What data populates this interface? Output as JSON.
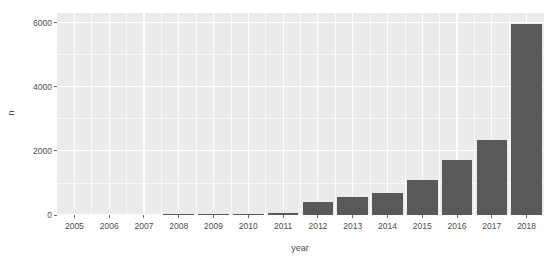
{
  "chart_data": {
    "type": "bar",
    "title": "",
    "xlabel": "year",
    "ylabel": "n",
    "categories": [
      "2005",
      "2006",
      "2007",
      "2008",
      "2009",
      "2010",
      "2011",
      "2012",
      "2013",
      "2014",
      "2015",
      "2016",
      "2017",
      "2018"
    ],
    "values": [
      0,
      0,
      0,
      25,
      20,
      30,
      75,
      420,
      560,
      700,
      1100,
      1730,
      2350,
      5950
    ],
    "ylim": [
      0,
      6300
    ],
    "y_ticks": [
      0,
      2000,
      4000,
      6000
    ],
    "y_tick_labels": [
      "0",
      "2000",
      "4000",
      "6000"
    ],
    "y_minor_ticks": [
      1000,
      3000,
      5000
    ],
    "grid": true,
    "legend": "none",
    "bar_color": "#595959",
    "panel_color": "#ebebeb",
    "grid_color": "#ffffff",
    "text_color": "#4d4d4d"
  },
  "axes": {
    "y_title": "n",
    "x_title": "year"
  }
}
